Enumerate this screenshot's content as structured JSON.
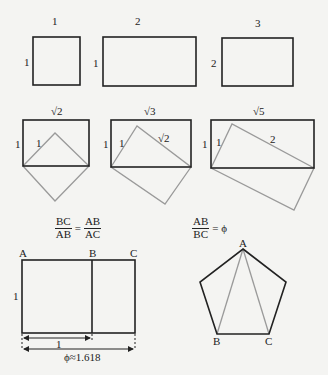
{
  "colors": {
    "frame": "#222222",
    "construction": "#9a9a9a",
    "background": "#f4f4f2"
  },
  "row1": {
    "rects": [
      {
        "top_label": "1",
        "side_label": "1"
      },
      {
        "top_label": "2",
        "side_label": "1"
      },
      {
        "top_label": "3",
        "side_label": "2"
      }
    ]
  },
  "row2": {
    "rects": [
      {
        "top_label": "√2",
        "side_label": "1",
        "inner_labels": [
          "1"
        ]
      },
      {
        "top_label": "√3",
        "side_label": "1",
        "inner_labels": [
          "1",
          "√2"
        ]
      },
      {
        "top_label": "√5",
        "side_label": "1",
        "inner_labels": [
          "1",
          "2"
        ]
      }
    ]
  },
  "golden_rectangle": {
    "equation": {
      "lhs_num": "BC",
      "lhs_den": "AB",
      "eq": "=",
      "rhs_num": "AB",
      "rhs_den": "AC"
    },
    "points": [
      "A",
      "B",
      "C"
    ],
    "side_label": "1",
    "inner_width_label": "1",
    "total_width_label": "ϕ≈1.618"
  },
  "pentagon": {
    "equation": {
      "num": "AB",
      "den": "BC",
      "eq": "= ϕ"
    },
    "points": [
      "A",
      "B",
      "C"
    ]
  }
}
